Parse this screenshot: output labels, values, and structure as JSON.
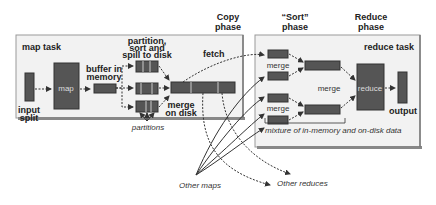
{
  "phases": {
    "copy": [
      "Copy",
      "phase"
    ],
    "sort": [
      "“Sort”",
      "phase"
    ],
    "reduce": [
      "Reduce",
      "phase"
    ]
  },
  "map_task": {
    "title": "map task",
    "input_split": [
      "input",
      "split"
    ],
    "map": "map",
    "buffer": [
      "buffer in",
      "memory"
    ],
    "partition": [
      "partition,",
      "sort and",
      "spill to disk"
    ],
    "partitions": "partitions",
    "merge_on_disk": [
      "merge",
      "on disk"
    ],
    "fetch": "fetch"
  },
  "reduce_task": {
    "title": "reduce task",
    "merge_top": "merge",
    "merge_mid": "merge",
    "merge_bottom": "merge",
    "reduce": "reduce",
    "output": "output",
    "mixture": "mixture of in-memory and on-disk data"
  },
  "external": {
    "other_maps": "Other maps",
    "other_reduces": "Other reduces"
  },
  "colors": {
    "box": "#555555",
    "panel": "#f2f2f2",
    "line": "#333333"
  }
}
